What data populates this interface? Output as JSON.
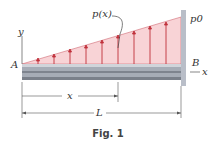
{
  "figure": {
    "caption": "Fig. 1",
    "load_label": "p(x)",
    "max_load_label": "p0",
    "point_a": "A",
    "point_b": "B",
    "axis_y": "y",
    "axis_x": "x",
    "dim_x": "x",
    "dim_L": "L",
    "colors": {
      "load_fill": "#f7c9cc",
      "arrow": "#c0303a",
      "beam": "#9aa0aa",
      "wall": "#b9bec8"
    }
  }
}
